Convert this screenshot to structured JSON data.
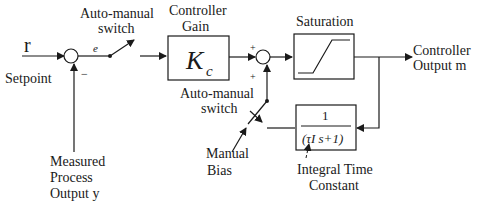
{
  "diagram": {
    "inputs": {
      "setpoint_symbol": "r",
      "setpoint_label": "Setpoint",
      "error_symbol": "e",
      "minus_sign": "−",
      "measured_line1": "Measured",
      "measured_line2": "Process",
      "measured_line3": "Output y"
    },
    "switch1": {
      "line1": "Auto-manual",
      "line2": "switch"
    },
    "gain_block": {
      "label_line1": "Controller",
      "label_line2": "Gain",
      "symbol": "K",
      "subscript": "c"
    },
    "summer2": {
      "plus_top": "+",
      "plus_bottom": "+"
    },
    "saturation": {
      "label": "Saturation"
    },
    "output": {
      "line1": "Controller",
      "line2": "Output m"
    },
    "switch2": {
      "line1": "Auto-manual",
      "line2": "switch"
    },
    "manual_bias": {
      "line1": "Manual",
      "line2": "Bias"
    },
    "filter_block": {
      "numerator": "1",
      "denominator": "(τI s+1)",
      "label_line1": "Integral Time",
      "label_line2": "Constant"
    },
    "colors": {
      "line": "#1a1a1a",
      "background": "#ffffff"
    }
  }
}
